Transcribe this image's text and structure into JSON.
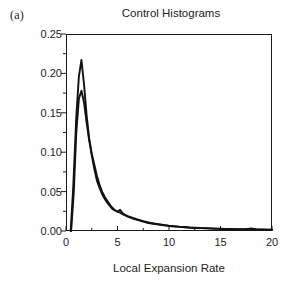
{
  "panel": {
    "label": "(a)"
  },
  "chart_data": {
    "type": "line",
    "title": "Control Histograms",
    "subtitle": "",
    "xlabel": "Local Expansion Rate",
    "ylabel": "",
    "xlim": [
      0,
      20
    ],
    "ylim": [
      0,
      0.25
    ],
    "grid": false,
    "legend": null,
    "frame": "box",
    "xticks": [
      0,
      5,
      10,
      15,
      20
    ],
    "xtick_labels": [
      "0",
      "5",
      "10",
      "15",
      "20"
    ],
    "xminor_ticks": [
      2.5,
      7.5,
      12.5,
      17.5
    ],
    "yticks": [
      0.0,
      0.05,
      0.1,
      0.15,
      0.2,
      0.25
    ],
    "ytick_labels": [
      "0.00",
      "0.05",
      "0.10",
      "0.15",
      "0.20",
      "0.25"
    ],
    "yminor_ticks": [
      0.025,
      0.075,
      0.125,
      0.175,
      0.225
    ],
    "line_color": "#111111",
    "series": [
      {
        "name": "control-histogram-1",
        "color": "#111111",
        "x": [
          0.45,
          0.7,
          1.0,
          1.25,
          1.5,
          1.75,
          2.0,
          2.25,
          2.5,
          2.75,
          3.0,
          3.25,
          3.5,
          3.75,
          4.0,
          4.25,
          4.5,
          4.75,
          5.0,
          5.25,
          5.5,
          5.75,
          6.0,
          6.5,
          7.0,
          7.5,
          8.0,
          8.5,
          9.0,
          9.5,
          10.0,
          10.5,
          11.0,
          11.5,
          12.0,
          12.5,
          13.0,
          13.5,
          14.0,
          14.5,
          15.0,
          15.5,
          16.0,
          16.5,
          17.0,
          17.5,
          18.0,
          18.5,
          19.0,
          19.5,
          20.0
        ],
        "y": [
          0.0,
          0.055,
          0.145,
          0.196,
          0.217,
          0.186,
          0.147,
          0.118,
          0.096,
          0.079,
          0.064,
          0.055,
          0.047,
          0.041,
          0.036,
          0.032,
          0.028,
          0.026,
          0.0245,
          0.027,
          0.0225,
          0.0205,
          0.019,
          0.0165,
          0.0145,
          0.0125,
          0.0108,
          0.0095,
          0.0085,
          0.0078,
          0.0068,
          0.0062,
          0.0055,
          0.005,
          0.0045,
          0.0042,
          0.0038,
          0.0036,
          0.0033,
          0.003,
          0.0028,
          0.0026,
          0.0025,
          0.0023,
          0.0022,
          0.0022,
          0.0031,
          0.0021,
          0.0019,
          0.0018,
          0.0018
        ]
      },
      {
        "name": "control-histogram-2",
        "color": "#111111",
        "x": [
          0.5,
          0.75,
          1.0,
          1.25,
          1.5,
          1.75,
          2.0,
          2.25,
          2.5,
          2.75,
          3.0,
          3.25,
          3.5,
          3.75,
          4.0,
          4.25,
          4.5,
          4.75,
          5.0,
          5.25,
          5.5,
          5.75,
          6.0,
          6.5,
          7.0,
          7.5,
          8.0,
          8.5,
          9.0,
          9.5,
          10.0,
          10.5,
          11.0,
          11.5,
          12.0,
          12.5,
          13.0,
          13.5,
          14.0,
          14.5,
          15.0,
          15.5,
          16.0,
          16.5,
          17.0,
          17.5,
          18.0,
          18.5,
          19.0,
          19.5,
          20.0
        ],
        "y": [
          0.0,
          0.048,
          0.125,
          0.168,
          0.178,
          0.163,
          0.138,
          0.115,
          0.098,
          0.084,
          0.07,
          0.059,
          0.05,
          0.0435,
          0.0385,
          0.0335,
          0.0295,
          0.0265,
          0.0245,
          0.0232,
          0.0215,
          0.0198,
          0.0182,
          0.0158,
          0.0138,
          0.0118,
          0.0102,
          0.0092,
          0.0082,
          0.0072,
          0.0064,
          0.0058,
          0.0052,
          0.0047,
          0.0043,
          0.0039,
          0.0036,
          0.0034,
          0.0031,
          0.0029,
          0.0027,
          0.0025,
          0.0024,
          0.0022,
          0.0021,
          0.0021,
          0.0026,
          0.002,
          0.0018,
          0.0017,
          0.0017
        ]
      }
    ]
  }
}
